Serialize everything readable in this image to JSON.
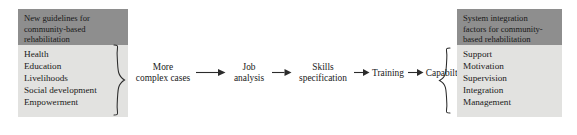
{
  "diagram": {
    "type": "flow-diagram",
    "left_group": {
      "header": [
        "New guidelines for",
        "community-based",
        "rehabilitation"
      ],
      "header_text": "New guidelines for community-based rehabilitation",
      "items": [
        "Health",
        "Education",
        "Livelihoods",
        "Social development",
        "Empowerment"
      ]
    },
    "right_group": {
      "header": [
        "System integration",
        "factors for community-",
        "based rehabilitation"
      ],
      "header_text": "System integration factors for community-based rehabilitation",
      "items": [
        "Support",
        "Motivation",
        "Supervision",
        "Integration",
        "Management"
      ]
    },
    "flow": [
      {
        "line1": "More",
        "line2": "complex cases"
      },
      {
        "line1": "Job",
        "line2": "analysis"
      },
      {
        "line1": "Skills",
        "line2": "specification"
      },
      {
        "line1": "Training",
        "line2": ""
      },
      {
        "line1": "Capabilty",
        "line2": ""
      }
    ],
    "colors": {
      "header_fill": "#8e8e8e",
      "body_fill": "#e2e2e0",
      "text": "#1a1a1a",
      "stroke": "#2b2b2b",
      "background": "#ffffff"
    }
  }
}
